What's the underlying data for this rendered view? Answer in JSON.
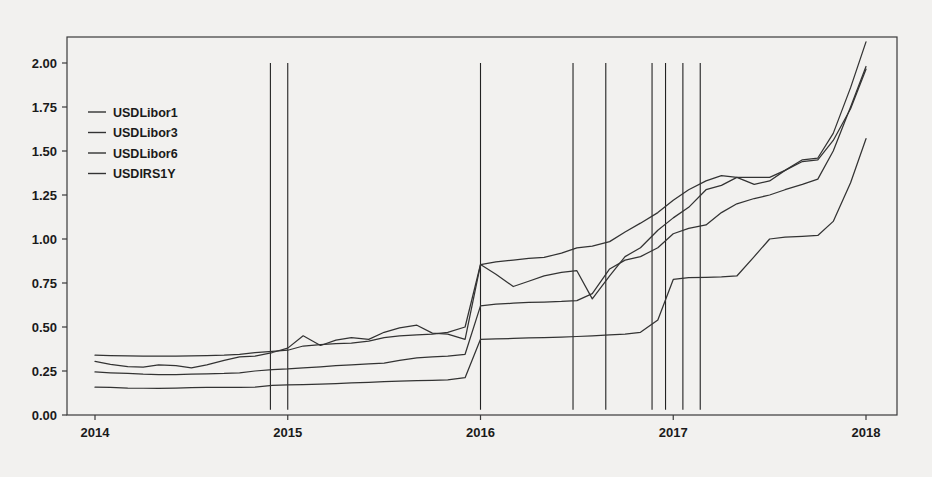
{
  "chart_data": {
    "type": "line",
    "title": "",
    "xlabel": "",
    "ylabel": "",
    "xlim": [
      2013.85,
      2018.15
    ],
    "ylim": [
      0.0,
      2.15
    ],
    "grid": false,
    "legend_position": "top-left",
    "yticks": [
      "0.00",
      "0.25",
      "0.50",
      "0.75",
      "1.00",
      "1.25",
      "1.50",
      "1.75",
      "2.00"
    ],
    "ytick_values": [
      0.0,
      0.25,
      0.5,
      0.75,
      1.0,
      1.25,
      1.5,
      1.75,
      2.0
    ],
    "xticks": [
      "2014",
      "2015",
      "2016",
      "2017",
      "2018"
    ],
    "xtick_values": [
      2014,
      2015,
      2016,
      2017,
      2018
    ],
    "legend": [
      "USDLibor1",
      "USDLibor3",
      "USDLibor6",
      "USDIRS1Y"
    ],
    "series": [
      {
        "name": "USDLibor1",
        "color": "#333333",
        "x": [
          2014.0,
          2014.08,
          2014.17,
          2014.25,
          2014.33,
          2014.42,
          2014.5,
          2014.58,
          2014.67,
          2014.75,
          2014.83,
          2014.92,
          2015.0,
          2015.08,
          2015.17,
          2015.25,
          2015.33,
          2015.42,
          2015.5,
          2015.58,
          2015.67,
          2015.75,
          2015.83,
          2015.92,
          2016.0,
          2016.08,
          2016.17,
          2016.25,
          2016.33,
          2016.42,
          2016.5,
          2016.58,
          2016.67,
          2016.75,
          2016.83,
          2016.92,
          2017.0,
          2017.08,
          2017.17,
          2017.25,
          2017.33,
          2017.42,
          2017.5,
          2017.58,
          2017.67,
          2017.75,
          2017.83,
          2017.92,
          2018.0
        ],
        "y": [
          0.158,
          0.157,
          0.153,
          0.152,
          0.152,
          0.153,
          0.155,
          0.157,
          0.157,
          0.157,
          0.158,
          0.168,
          0.171,
          0.172,
          0.175,
          0.178,
          0.182,
          0.186,
          0.19,
          0.193,
          0.195,
          0.197,
          0.2,
          0.212,
          0.43,
          0.432,
          0.435,
          0.438,
          0.44,
          0.443,
          0.446,
          0.45,
          0.455,
          0.46,
          0.47,
          0.54,
          0.77,
          0.78,
          0.782,
          0.785,
          0.79,
          0.9,
          1.0,
          1.01,
          1.015,
          1.02,
          1.1,
          1.32,
          1.57
        ]
      },
      {
        "name": "USDLibor3",
        "color": "#333333",
        "x": [
          2014.0,
          2014.08,
          2014.17,
          2014.25,
          2014.33,
          2014.42,
          2014.5,
          2014.58,
          2014.67,
          2014.75,
          2014.83,
          2014.92,
          2015.0,
          2015.08,
          2015.17,
          2015.25,
          2015.33,
          2015.42,
          2015.5,
          2015.58,
          2015.67,
          2015.75,
          2015.83,
          2015.92,
          2016.0,
          2016.08,
          2016.17,
          2016.25,
          2016.33,
          2016.42,
          2016.5,
          2016.58,
          2016.67,
          2016.75,
          2016.83,
          2016.92,
          2017.0,
          2017.08,
          2017.17,
          2017.25,
          2017.33,
          2017.42,
          2017.5,
          2017.58,
          2017.67,
          2017.75,
          2017.83,
          2017.92,
          2018.0
        ],
        "y": [
          0.245,
          0.24,
          0.236,
          0.232,
          0.23,
          0.23,
          0.232,
          0.234,
          0.236,
          0.24,
          0.25,
          0.258,
          0.262,
          0.268,
          0.274,
          0.28,
          0.285,
          0.29,
          0.295,
          0.31,
          0.325,
          0.33,
          0.335,
          0.345,
          0.62,
          0.63,
          0.635,
          0.64,
          0.642,
          0.645,
          0.65,
          0.69,
          0.83,
          0.88,
          0.9,
          0.95,
          1.03,
          1.06,
          1.08,
          1.15,
          1.2,
          1.23,
          1.25,
          1.28,
          1.31,
          1.34,
          1.5,
          1.75,
          1.98
        ]
      },
      {
        "name": "USDLibor6",
        "color": "#333333",
        "x": [
          2014.0,
          2014.08,
          2014.17,
          2014.25,
          2014.33,
          2014.42,
          2014.5,
          2014.58,
          2014.67,
          2014.75,
          2014.83,
          2014.92,
          2015.0,
          2015.08,
          2015.17,
          2015.25,
          2015.33,
          2015.42,
          2015.5,
          2015.58,
          2015.67,
          2015.75,
          2015.83,
          2015.92,
          2016.0,
          2016.08,
          2016.17,
          2016.25,
          2016.33,
          2016.42,
          2016.5,
          2016.58,
          2016.67,
          2016.75,
          2016.83,
          2016.92,
          2017.0,
          2017.08,
          2017.17,
          2017.25,
          2017.33,
          2017.42,
          2017.5,
          2017.58,
          2017.67,
          2017.75,
          2017.83,
          2017.92,
          2018.0
        ],
        "y": [
          0.34,
          0.338,
          0.336,
          0.334,
          0.334,
          0.335,
          0.336,
          0.338,
          0.34,
          0.345,
          0.355,
          0.362,
          0.368,
          0.392,
          0.4,
          0.405,
          0.408,
          0.42,
          0.44,
          0.45,
          0.455,
          0.46,
          0.47,
          0.5,
          0.855,
          0.87,
          0.88,
          0.89,
          0.895,
          0.92,
          0.95,
          0.96,
          0.985,
          1.04,
          1.09,
          1.15,
          1.22,
          1.28,
          1.33,
          1.36,
          1.35,
          1.35,
          1.35,
          1.39,
          1.45,
          1.46,
          1.6,
          1.86,
          2.12
        ]
      },
      {
        "name": "USDIRS1Y",
        "color": "#333333",
        "x": [
          2014.0,
          2014.08,
          2014.17,
          2014.25,
          2014.33,
          2014.42,
          2014.5,
          2014.58,
          2014.67,
          2014.75,
          2014.83,
          2014.92,
          2015.0,
          2015.08,
          2015.17,
          2015.25,
          2015.33,
          2015.42,
          2015.5,
          2015.58,
          2015.67,
          2015.75,
          2015.83,
          2015.92,
          2016.0,
          2016.08,
          2016.17,
          2016.25,
          2016.33,
          2016.42,
          2016.5,
          2016.58,
          2016.67,
          2016.75,
          2016.83,
          2016.92,
          2017.0,
          2017.08,
          2017.17,
          2017.25,
          2017.33,
          2017.42,
          2017.5,
          2017.58,
          2017.67,
          2017.75,
          2017.83,
          2017.92,
          2018.0
        ],
        "y": [
          0.305,
          0.288,
          0.275,
          0.272,
          0.285,
          0.28,
          0.268,
          0.285,
          0.31,
          0.33,
          0.335,
          0.355,
          0.38,
          0.45,
          0.395,
          0.425,
          0.44,
          0.43,
          0.47,
          0.495,
          0.51,
          0.465,
          0.46,
          0.43,
          0.855,
          0.8,
          0.73,
          0.76,
          0.79,
          0.81,
          0.82,
          0.66,
          0.79,
          0.9,
          0.95,
          1.05,
          1.12,
          1.18,
          1.28,
          1.305,
          1.35,
          1.31,
          1.33,
          1.39,
          1.44,
          1.45,
          1.56,
          1.74,
          1.965
        ]
      }
    ],
    "event_lines": {
      "color": "#222222",
      "y_top": 2.0,
      "y_bottom": 0.03,
      "x": [
        2014.91,
        2015.0,
        2016.0,
        2016.48,
        2016.65,
        2016.89,
        2016.96,
        2017.05,
        2017.14
      ]
    }
  }
}
